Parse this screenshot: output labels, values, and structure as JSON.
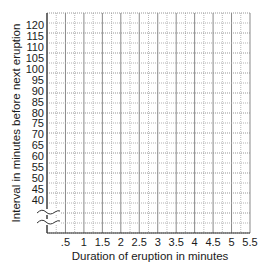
{
  "chart_data": {
    "type": "scatter",
    "title": "",
    "xlabel": "Duration of eruption in minutes",
    "ylabel": "Interval in minutes before next eruption",
    "x_ticks": [
      ".5",
      "1",
      "1.5",
      "2",
      "2.5",
      "3",
      "3.5",
      "4",
      "4.5",
      "5",
      "5.5"
    ],
    "y_ticks": [
      "40",
      "45",
      "50",
      "55",
      "60",
      "65",
      "70",
      "75",
      "80",
      "85",
      "90",
      "95",
      "100",
      "105",
      "110",
      "115",
      "120"
    ],
    "xlim": [
      0,
      5.5
    ],
    "ylim": [
      40,
      120
    ],
    "y_axis_break": true,
    "grid": true,
    "series": [],
    "note": "Blank graph grid with no data points plotted"
  },
  "colors": {
    "grid_major": "#8a8a8a",
    "grid_minor": "#a8a8a8",
    "axis": "#333333",
    "text": "#1a1a1a"
  }
}
